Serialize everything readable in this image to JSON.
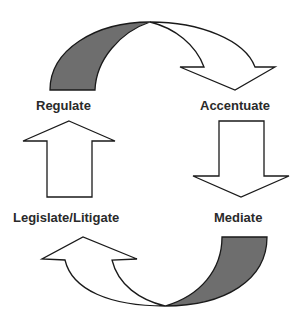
{
  "diagram": {
    "type": "cycle",
    "nodes": [
      {
        "id": "regulate",
        "label": "Regulate"
      },
      {
        "id": "accentuate",
        "label": "Accentuate"
      },
      {
        "id": "mediate",
        "label": "Mediate"
      },
      {
        "id": "legislate",
        "label": "Legislate/Litigate"
      }
    ],
    "edges": [
      {
        "from": "regulate",
        "to": "accentuate",
        "style": "curved-arrow-shaded-tail"
      },
      {
        "from": "accentuate",
        "to": "mediate",
        "style": "block-arrow-down"
      },
      {
        "from": "mediate",
        "to": "legislate",
        "style": "curved-arrow-shaded-tail"
      },
      {
        "from": "legislate",
        "to": "regulate",
        "style": "block-arrow-up"
      }
    ],
    "colors": {
      "stroke": "#1a1a1a",
      "shade": "#6e6e6e",
      "fill": "#ffffff"
    }
  }
}
